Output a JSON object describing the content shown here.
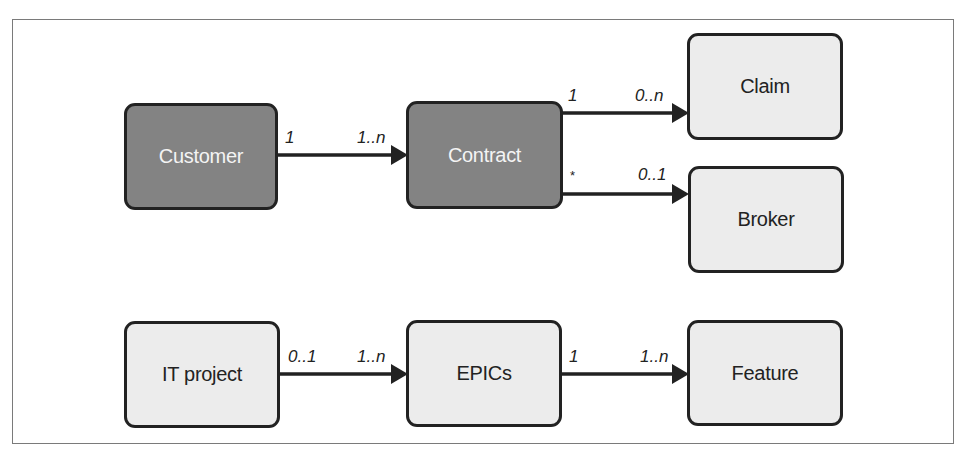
{
  "diagram": {
    "type": "entity-relationship",
    "colors": {
      "dark_fill": "#838383",
      "light_fill": "#ececec",
      "border": "#222222",
      "frame": "#7a7a7a"
    },
    "nodes": {
      "customer": {
        "label": "Customer",
        "style": "dark"
      },
      "contract": {
        "label": "Contract",
        "style": "dark"
      },
      "claim": {
        "label": "Claim",
        "style": "light"
      },
      "broker": {
        "label": "Broker",
        "style": "light"
      },
      "it_project": {
        "label": "IT project",
        "style": "light"
      },
      "epics": {
        "label": "EPICs",
        "style": "light"
      },
      "feature": {
        "label": "Feature",
        "style": "light"
      }
    },
    "edges": {
      "customer_contract": {
        "from": "Customer",
        "to": "Contract",
        "source_mult": "1",
        "target_mult": "1..n"
      },
      "contract_claim": {
        "from": "Contract",
        "to": "Claim",
        "source_mult": "1",
        "target_mult": "0..n"
      },
      "contract_broker": {
        "from": "Contract",
        "to": "Broker",
        "source_mult": "*",
        "target_mult": "0..1"
      },
      "itproject_epics": {
        "from": "IT project",
        "to": "EPICs",
        "source_mult": "0..1",
        "target_mult": "1..n"
      },
      "epics_feature": {
        "from": "EPICs",
        "to": "Feature",
        "source_mult": "1",
        "target_mult": "1..n"
      }
    }
  }
}
